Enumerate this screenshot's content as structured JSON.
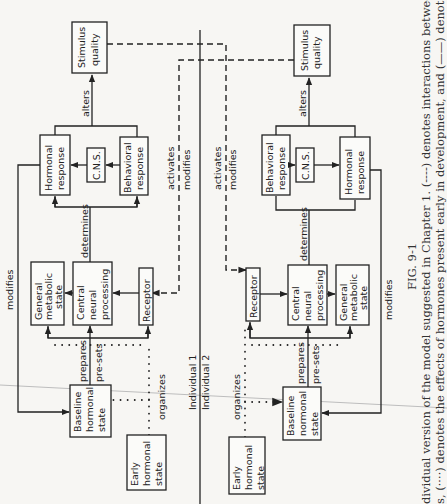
{
  "figure": {
    "number": "FIG. 9-1",
    "caption_line1": "dividual version of the model suggested in Chapter 1. (----) denotes interactions between",
    "caption_line2": "s, (····) denotes the effects of hormones present early in development, and (——) denotes"
  },
  "divider": {
    "top_label": "Individual 1",
    "bottom_label": "Individual 2"
  },
  "individual1": {
    "stimulus_quality": [
      "Stimulus",
      "quality"
    ],
    "hormonal_response": [
      "Hormonal",
      "response"
    ],
    "cns": "C.N.S.",
    "behavioral_response": [
      "Behavioral",
      "response"
    ],
    "general_metabolic_state": [
      "General",
      "metabolic",
      "state"
    ],
    "central_neural_processing": [
      "Central",
      "neural",
      "processing"
    ],
    "receptor": "Receptor",
    "baseline_hormonal_state": [
      "Baseline",
      "hormonal",
      "state"
    ],
    "early_hormonal_state": [
      "Early",
      "hormonal",
      "state"
    ],
    "labels": {
      "alters": "alters",
      "determines": "determines",
      "modifies": "modifies",
      "prepares": "prepares",
      "presets": "pre-sets",
      "organizes": "organizes",
      "activates": "activates",
      "modifies_dashed": "modifies"
    }
  },
  "individual2": {
    "stimulus_quality": [
      "Stimulus",
      "quality"
    ],
    "behavioral_response": [
      "Behavioral",
      "response"
    ],
    "cns": "C.N.S.",
    "hormonal_response": [
      "Hormonal",
      "response"
    ],
    "receptor": "Receptor",
    "central_neural_processing": [
      "Central",
      "neural",
      "processing"
    ],
    "general_metabolic_state": [
      "General",
      "metabolic",
      "state"
    ],
    "baseline_hormonal_state": [
      "Baseline",
      "normonal",
      "state"
    ],
    "early_hormonal_state": [
      "Early",
      "hormonal",
      "state"
    ],
    "labels": {
      "alters": "alters",
      "determines": "determines",
      "modifies": "modifies",
      "prepares": "prepares",
      "presets": "pre-sets",
      "organizes": "organizes",
      "activates": "activates",
      "modifies_dashed": "modifies"
    }
  }
}
